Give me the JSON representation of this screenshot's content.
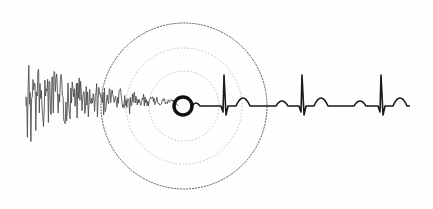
{
  "illustration": {
    "subject": "noise-to-heartbeat signal with concentric ripple circles",
    "colors": {
      "background": "#fefefe",
      "noise": "#4a4a4a",
      "ecg": "#1a1a1a",
      "ring": "#111111",
      "outer_circle": "#555555",
      "inner_circles": "#bdbdbd"
    },
    "center": {
      "x": 184,
      "y": 106
    },
    "circles": [
      {
        "r": 83,
        "style": "dashed-dark"
      },
      {
        "r": 58,
        "style": "dotted-light"
      },
      {
        "r": 35,
        "style": "dotted-light"
      }
    ],
    "focus_ring": {
      "x": 183,
      "y": 106,
      "r": 9
    },
    "noise": {
      "x_start": 26,
      "x_end": 174,
      "baseline": 106,
      "max_amplitude": 60
    },
    "ecg": {
      "baseline": 106,
      "beats": [
        {
          "qrs_x": 224,
          "t_x": 243,
          "p_x": 205
        },
        {
          "qrs_x": 302,
          "t_x": 321,
          "p_x": 282
        },
        {
          "qrs_x": 381,
          "t_x": 400,
          "p_x": 360
        }
      ],
      "end_x": 410
    }
  }
}
